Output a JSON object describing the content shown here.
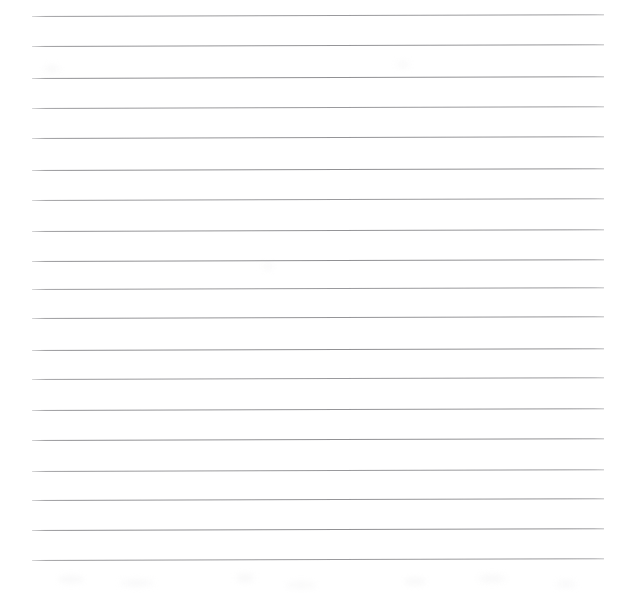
{
  "document": {
    "kind": "scanned-ruled-paper",
    "title": "",
    "body_text": "",
    "page_width": 635,
    "page_height": 593,
    "background_color": "#fefefe",
    "rule_color": "#8d8d90",
    "rule_thickness_px": 1,
    "rule_left_x": 32,
    "rule_right_x": 604,
    "rule_spacing_px": 30,
    "rule_skew_deg": -0.18,
    "rule_count": 19,
    "rule_y_positions": [
      16,
      46,
      78,
      108,
      138,
      170,
      200,
      231,
      261,
      289,
      318,
      350,
      379,
      410,
      440,
      471,
      500,
      530,
      560
    ],
    "artifacts": [
      {
        "x": 58,
        "y": 576,
        "w": 26,
        "h": 7
      },
      {
        "x": 120,
        "y": 580,
        "w": 34,
        "h": 6
      },
      {
        "x": 236,
        "y": 574,
        "w": 18,
        "h": 8
      },
      {
        "x": 286,
        "y": 582,
        "w": 30,
        "h": 6
      },
      {
        "x": 404,
        "y": 578,
        "w": 22,
        "h": 7
      },
      {
        "x": 478,
        "y": 575,
        "w": 28,
        "h": 7
      },
      {
        "x": 556,
        "y": 581,
        "w": 20,
        "h": 6
      },
      {
        "x": 44,
        "y": 66,
        "w": 16,
        "h": 6
      },
      {
        "x": 396,
        "y": 62,
        "w": 14,
        "h": 5
      },
      {
        "x": 262,
        "y": 264,
        "w": 12,
        "h": 5
      }
    ]
  }
}
